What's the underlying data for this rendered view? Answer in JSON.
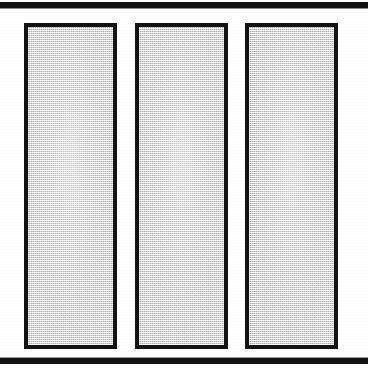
{
  "figure": {
    "sheet_label": "scanned-figure-sheet",
    "background_color": "#ffffff",
    "ink_color": "#131313",
    "panel_fill_color": "#d2d2d2",
    "orientation": "portrait",
    "rules": [
      {
        "name": "top-rule",
        "position": "top",
        "thickness_px": 6
      },
      {
        "name": "bottom-rule",
        "position": "bottom",
        "thickness_px": 6
      }
    ],
    "panels": [
      {
        "name": "panel-left",
        "index": 1,
        "fill": "halftone-gray",
        "border_color": "#131313",
        "border_px": 4,
        "label": ""
      },
      {
        "name": "panel-center",
        "index": 2,
        "fill": "halftone-gray",
        "border_color": "#131313",
        "border_px": 4,
        "label": ""
      },
      {
        "name": "panel-right",
        "index": 3,
        "fill": "halftone-gray",
        "border_color": "#131313",
        "border_px": 4,
        "label": ""
      }
    ]
  }
}
